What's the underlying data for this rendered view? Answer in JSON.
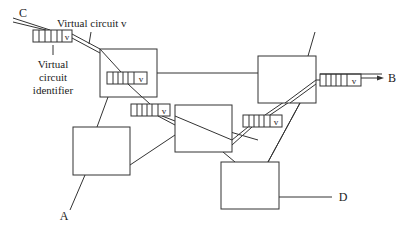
{
  "diagram": {
    "labels": {
      "virtual_circuit": "Virtual circuit v",
      "vci_line1": "Virtual",
      "vci_line2": "circuit",
      "vci_line3": "identifier"
    },
    "endpoints": {
      "A": "A",
      "B": "B",
      "C": "C",
      "D": "D"
    },
    "queue_label": "v",
    "queues": [
      {
        "id": "queue-entry",
        "label": "v"
      },
      {
        "id": "queue-switch-1",
        "label": "v"
      },
      {
        "id": "queue-switch-1-out",
        "label": "v"
      },
      {
        "id": "queue-switch-3-out",
        "label": "v"
      },
      {
        "id": "queue-exit",
        "label": "v"
      }
    ],
    "switches": [
      "switch-1",
      "switch-2",
      "switch-3",
      "switch-4",
      "switch-5"
    ],
    "colors": {
      "stroke": "#333333",
      "text": "#222222",
      "background": "#ffffff"
    }
  }
}
